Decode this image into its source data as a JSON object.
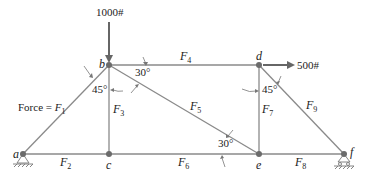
{
  "diagram": {
    "type": "truss",
    "joints": [
      {
        "id": "a",
        "label": "a",
        "x": 23,
        "y": 154,
        "support": "pin"
      },
      {
        "id": "b",
        "label": "b",
        "x": 109,
        "y": 65
      },
      {
        "id": "c",
        "label": "c",
        "x": 109,
        "y": 154
      },
      {
        "id": "d",
        "label": "d",
        "x": 259,
        "y": 65
      },
      {
        "id": "e",
        "label": "e",
        "x": 259,
        "y": 154
      },
      {
        "id": "f",
        "label": "f",
        "x": 344,
        "y": 154,
        "support": "roller"
      }
    ],
    "members": [
      {
        "name": "F",
        "sub": "1",
        "from": "a",
        "to": "b",
        "prefix": "Force = "
      },
      {
        "name": "F",
        "sub": "2",
        "from": "a",
        "to": "c"
      },
      {
        "name": "F",
        "sub": "3",
        "from": "b",
        "to": "c"
      },
      {
        "name": "F",
        "sub": "4",
        "from": "b",
        "to": "d"
      },
      {
        "name": "F",
        "sub": "5",
        "from": "b",
        "to": "e"
      },
      {
        "name": "F",
        "sub": "6",
        "from": "c",
        "to": "e"
      },
      {
        "name": "F",
        "sub": "7",
        "from": "d",
        "to": "e"
      },
      {
        "name": "F",
        "sub": "8",
        "from": "e",
        "to": "f"
      },
      {
        "name": "F",
        "sub": "9",
        "from": "d",
        "to": "f"
      }
    ],
    "loads": [
      {
        "label": "1000#",
        "joint": "b",
        "direction": "down"
      },
      {
        "label": "500#",
        "joint": "d",
        "direction": "right"
      }
    ],
    "angles": [
      {
        "label": "45°",
        "at": "b"
      },
      {
        "label": "30°",
        "at": "b"
      },
      {
        "label": "45°",
        "at": "d"
      },
      {
        "label": "30°",
        "at": "e"
      }
    ]
  },
  "labels": {
    "force_prefix": "Force = ",
    "F": "F",
    "s1": "1",
    "s2": "2",
    "s3": "3",
    "s4": "4",
    "s5": "5",
    "s6": "6",
    "s7": "7",
    "s8": "8",
    "s9": "9",
    "a": "a",
    "b": "b",
    "c": "c",
    "d": "d",
    "e": "e",
    "f": "f",
    "load_b": "1000#",
    "load_d": "500#",
    "angle_b_45": "45°",
    "angle_b_30": "30°",
    "angle_d_45": "45°",
    "angle_e_30": "30°"
  }
}
